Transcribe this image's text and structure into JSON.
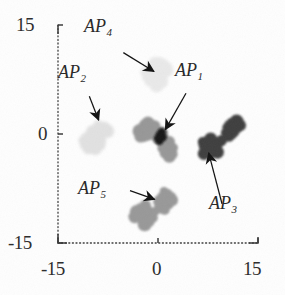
{
  "figure": {
    "kind": "scatter-plot",
    "background": "#fefefe",
    "axis_color": "#3a3a3a"
  },
  "chart_data": {
    "type": "scatter",
    "title": "",
    "xlabel": "",
    "ylabel": "",
    "xlim": [
      -15,
      15
    ],
    "ylim": [
      -15,
      15
    ],
    "grid": false,
    "legend": "none",
    "xticks": [
      -15,
      0,
      15
    ],
    "yticks": [
      -15,
      0,
      15
    ],
    "xtick_labels": [
      "-15",
      "0",
      "15"
    ],
    "ytick_labels": [
      "-15",
      "0",
      "15"
    ],
    "annotations": [
      {
        "text": "AP",
        "subscript": "4",
        "label": "AP4",
        "x": -7.5,
        "y": 12.2
      },
      {
        "text": "AP",
        "subscript": "2",
        "label": "AP2",
        "x": -11.0,
        "y": 6.8
      },
      {
        "text": "AP",
        "subscript": "1",
        "label": "AP1",
        "x": 3.5,
        "y": 7.2
      },
      {
        "text": "AP",
        "subscript": "5",
        "label": "AP5",
        "x": -7.0,
        "y": -7.4
      },
      {
        "text": "AP",
        "subscript": "3",
        "label": "AP3",
        "x": 9.2,
        "y": -11.5
      }
    ],
    "arrows": [
      {
        "for": "AP4",
        "from_x": -5.2,
        "from_y": 11.2,
        "to_x": -0.6,
        "to_y": 8.6
      },
      {
        "for": "AP2",
        "from_x": -10.3,
        "from_y": 5.2,
        "to_x": -8.9,
        "to_y": 1.9
      },
      {
        "for": "AP1",
        "from_x": 4.2,
        "from_y": 5.6,
        "to_x": 1.1,
        "to_y": 0.6
      },
      {
        "for": "AP5",
        "from_x": -4.2,
        "from_y": -7.8,
        "to_x": -0.5,
        "to_y": -9.0
      },
      {
        "for": "AP3",
        "from_x": 9.6,
        "from_y": -9.6,
        "to_x": 7.6,
        "to_y": -2.6
      }
    ],
    "series": [
      {
        "name": "AP1",
        "color": "#8f8f8f",
        "shade": "medium-gray",
        "center": [
          0.4,
          -0.4
        ],
        "points": [
          [
            -2.5,
            0.9
          ],
          [
            -2.0,
            1.3
          ],
          [
            -1.5,
            1.5
          ],
          [
            -1.0,
            1.4
          ],
          [
            -0.5,
            1.1
          ],
          [
            -2.8,
            0.4
          ],
          [
            -2.4,
            0.1
          ],
          [
            -1.9,
            0.5
          ],
          [
            -1.4,
            0.8
          ],
          [
            -0.9,
            0.6
          ],
          [
            -2.6,
            -0.3
          ],
          [
            -2.1,
            -0.5
          ],
          [
            -1.6,
            -0.2
          ],
          [
            -1.1,
            0.1
          ],
          [
            -0.6,
            0.0
          ],
          [
            0.2,
            -0.1
          ],
          [
            0.5,
            0.1
          ],
          [
            0.7,
            -0.4
          ],
          [
            0.4,
            -0.7
          ],
          [
            0.1,
            -0.5
          ],
          [
            1.2,
            -1.5
          ],
          [
            1.6,
            -1.1
          ],
          [
            2.0,
            -1.6
          ],
          [
            1.4,
            -2.1
          ],
          [
            1.9,
            -2.4
          ],
          [
            2.3,
            -1.9
          ],
          [
            1.1,
            -2.6
          ],
          [
            1.7,
            -3.0
          ],
          [
            2.2,
            -2.8
          ],
          [
            0.8,
            -1.9
          ]
        ]
      },
      {
        "name": "AP2",
        "color": "#e0e0e0",
        "shade": "very-light-gray",
        "center": [
          -9.5,
          0.0
        ],
        "points": [
          [
            -9.0,
            1.3
          ],
          [
            -8.5,
            1.0
          ],
          [
            -8.2,
            0.5
          ],
          [
            -8.7,
            0.2
          ],
          [
            -9.2,
            0.7
          ],
          [
            -9.8,
            0.3
          ],
          [
            -10.2,
            -0.2
          ],
          [
            -10.7,
            -0.6
          ],
          [
            -10.2,
            -1.1
          ],
          [
            -9.6,
            -0.8
          ],
          [
            -9.1,
            -0.4
          ],
          [
            -8.4,
            -0.9
          ],
          [
            -10.9,
            -1.5
          ],
          [
            -10.4,
            -1.9
          ],
          [
            -9.9,
            -1.6
          ],
          [
            -8.0,
            0.9
          ],
          [
            -7.6,
            0.4
          ],
          [
            -11.2,
            -0.9
          ],
          [
            -9.4,
            -2.1
          ],
          [
            -8.9,
            -1.4
          ]
        ]
      },
      {
        "name": "AP3",
        "color": "#2e2e2e",
        "shade": "very-dark-gray",
        "center": [
          9.0,
          -0.4
        ],
        "points": [
          [
            10.6,
            1.3
          ],
          [
            11.1,
            1.5
          ],
          [
            11.6,
            1.2
          ],
          [
            12.0,
            0.8
          ],
          [
            11.4,
            0.4
          ],
          [
            10.9,
            0.6
          ],
          [
            10.4,
            0.9
          ],
          [
            12.3,
            1.2
          ],
          [
            11.8,
            1.7
          ],
          [
            11.1,
            0.0
          ],
          [
            10.6,
            -0.2
          ],
          [
            10.1,
            0.2
          ],
          [
            7.4,
            -1.0
          ],
          [
            7.9,
            -0.7
          ],
          [
            8.3,
            -1.3
          ],
          [
            7.7,
            -1.8
          ],
          [
            7.1,
            -1.5
          ],
          [
            6.7,
            -1.1
          ],
          [
            8.6,
            -1.9
          ],
          [
            8.0,
            -2.4
          ],
          [
            7.3,
            -2.2
          ],
          [
            6.9,
            -2.7
          ],
          [
            9.1,
            -1.4
          ],
          [
            9.5,
            -0.9
          ],
          [
            8.9,
            -2.5
          ]
        ]
      },
      {
        "name": "AP4",
        "color": "#e8e8e8",
        "shade": "very-light-gray",
        "center": [
          -0.6,
          8.4
        ],
        "points": [
          [
            0.3,
            10.0
          ],
          [
            0.8,
            9.6
          ],
          [
            1.2,
            9.1
          ],
          [
            0.6,
            8.8
          ],
          [
            0.1,
            9.2
          ],
          [
            -0.4,
            9.7
          ],
          [
            -0.9,
            9.3
          ],
          [
            -1.3,
            8.8
          ],
          [
            -0.8,
            8.3
          ],
          [
            -0.3,
            8.0
          ],
          [
            0.2,
            8.4
          ],
          [
            0.9,
            8.1
          ],
          [
            -1.6,
            7.9
          ],
          [
            -1.1,
            7.4
          ],
          [
            -0.6,
            7.1
          ],
          [
            -0.1,
            7.5
          ],
          [
            0.5,
            7.2
          ],
          [
            -1.9,
            8.5
          ],
          [
            1.4,
            8.7
          ],
          [
            -0.2,
            6.7
          ]
        ]
      },
      {
        "name": "AP5",
        "color": "#909090",
        "shade": "medium-gray",
        "center": [
          -0.6,
          -9.6
        ],
        "points": [
          [
            0.9,
            -7.9
          ],
          [
            1.4,
            -8.3
          ],
          [
            1.8,
            -8.8
          ],
          [
            1.2,
            -9.2
          ],
          [
            0.7,
            -8.7
          ],
          [
            0.3,
            -9.3
          ],
          [
            1.6,
            -9.7
          ],
          [
            2.1,
            -9.1
          ],
          [
            0.5,
            -10.0
          ],
          [
            1.0,
            -10.4
          ],
          [
            -1.8,
            -10.4
          ],
          [
            -2.3,
            -10.8
          ],
          [
            -2.8,
            -11.2
          ],
          [
            -2.2,
            -11.7
          ],
          [
            -1.6,
            -11.3
          ],
          [
            -1.1,
            -10.9
          ],
          [
            -3.2,
            -10.7
          ],
          [
            -2.7,
            -10.2
          ],
          [
            -1.4,
            -12.0
          ],
          [
            -2.0,
            -12.4
          ],
          [
            -0.8,
            -11.5
          ],
          [
            -3.5,
            -11.4
          ],
          [
            -0.4,
            -10.6
          ],
          [
            -1.9,
            -9.8
          ]
        ]
      }
    ]
  }
}
